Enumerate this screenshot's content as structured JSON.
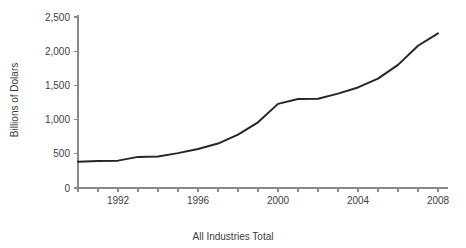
{
  "chart_data": {
    "type": "line",
    "title": "",
    "subtitle": "",
    "xlabel": "All Industries Total",
    "ylabel": "Billions of Dolars",
    "x": [
      1990,
      1991,
      1992,
      1993,
      1994,
      1995,
      1996,
      1997,
      1998,
      1999,
      2000,
      2001,
      2002,
      2003,
      2004,
      2005,
      2006,
      2007,
      2008
    ],
    "values": [
      385,
      395,
      400,
      455,
      460,
      510,
      570,
      650,
      780,
      960,
      1230,
      1300,
      1305,
      1380,
      1470,
      1600,
      1800,
      2080,
      2260
    ],
    "series": [
      {
        "name": "All Industries Total",
        "values": [
          385,
          395,
          400,
          455,
          460,
          510,
          570,
          650,
          780,
          960,
          1230,
          1300,
          1305,
          1380,
          1470,
          1600,
          1800,
          2080,
          2260
        ],
        "color": "#262626"
      }
    ],
    "xlim": [
      1990,
      2008
    ],
    "ylim": [
      0,
      2500
    ],
    "x_ticks": [
      1990,
      1991,
      1992,
      1993,
      1994,
      1995,
      1996,
      1997,
      1998,
      1999,
      2000,
      2001,
      2002,
      2003,
      2004,
      2005,
      2006,
      2007,
      2008
    ],
    "x_tick_labels": [
      "",
      "",
      "1992",
      "",
      "",
      "",
      "1996",
      "",
      "",
      "",
      "2000",
      "",
      "",
      "",
      "2004",
      "",
      "",
      "",
      "2008"
    ],
    "y_ticks": [
      0,
      500,
      1000,
      1500,
      2000,
      2500
    ],
    "y_tick_labels": [
      "0",
      "500",
      "1,000",
      "1,500",
      "2,000",
      "2,500"
    ],
    "grid": false,
    "legend": false,
    "legend_position": "none",
    "background_color": "#ffffff",
    "axis_color": "#8a8a8a",
    "text_color": "#3d3d3d"
  }
}
